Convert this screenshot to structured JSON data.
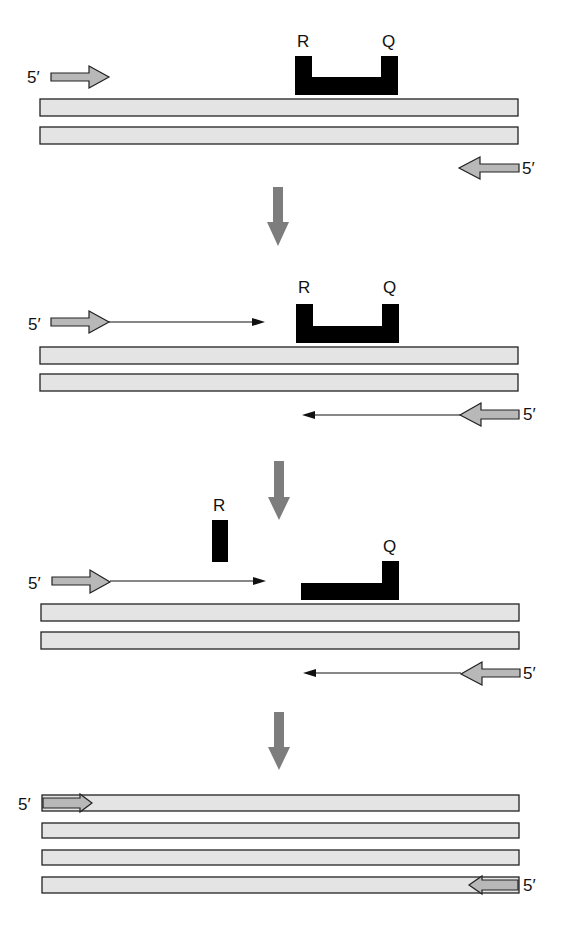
{
  "figure": {
    "colors": {
      "strand_fill": "#e4e4e4",
      "strand_outline": "#222222",
      "primer_fill": "#b8b8b8",
      "probe": "#000000",
      "step_arrow": "#7d7d7d",
      "background": "#ffffff"
    },
    "panels": [
      {
        "id": "annealing",
        "probe_labels": {
          "reporter": "R",
          "quencher": "Q"
        },
        "primer_labels": {
          "forward": "5′",
          "reverse": "5′"
        },
        "strands": 2,
        "extension_shown": false
      },
      {
        "id": "extension",
        "probe_labels": {
          "reporter": "R",
          "quencher": "Q"
        },
        "primer_labels": {
          "forward": "5′",
          "reverse": "5′"
        },
        "strands": 2,
        "extension_shown": true
      },
      {
        "id": "cleavage",
        "probe_labels": {
          "reporter": "R",
          "quencher": "Q"
        },
        "primer_labels": {
          "forward": "5′",
          "reverse": "5′"
        },
        "strands": 2,
        "extension_shown": true,
        "reporter_released": true
      },
      {
        "id": "products",
        "primer_labels": {
          "forward": "5′",
          "reverse": "5′"
        },
        "strands": 4
      }
    ],
    "step_arrows": 3
  }
}
